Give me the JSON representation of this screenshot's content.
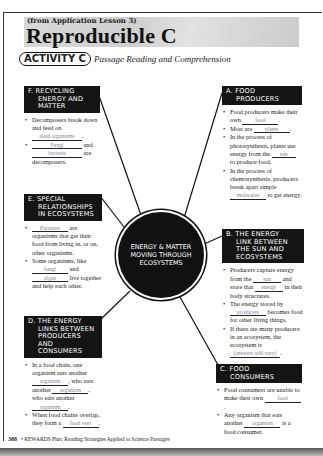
{
  "header": {
    "lesson_ref": "(from Application Lesson 3)",
    "title": "Reproducible C",
    "activity_badge": "ACTIVITY C",
    "activity_subtitle": "Passage Reading and Comprehension"
  },
  "center": {
    "line1": "ENERGY & MATTER",
    "line2": "MOVING THROUGH",
    "line3": "ECOSYSTEMS"
  },
  "panels": {
    "a": {
      "h1": "A.  FOOD",
      "h2": "PRODUCERS",
      "b1_pre": "Food producers make their own",
      "b1_ans": "food",
      "b1_post": ".",
      "b2_pre": "Most are",
      "b2_ans": "plants",
      "b2_post": ".",
      "b3_pre": "In the process of photosynthesis, plants use energy from the",
      "b3_ans": "sun",
      "b3_post": "to produce food.",
      "b4_pre": "In the process of chemosynthesis, producers break apart simple",
      "b4_ans": "molecules",
      "b4_post": "to get energy."
    },
    "b": {
      "h1": "B.  THE ENERGY",
      "h2": "LINK BETWEEN",
      "h3": "THE SUN AND",
      "h4": "ECOSYSTEMS",
      "b1_pre": "Producers capture energy from the",
      "b1_ans": "sun",
      "b1_mid": "and store that",
      "b1_ans2": "energy",
      "b1_post": "in their body structures.",
      "b2_pre": "The energy stored by",
      "b2_ans": "producers",
      "b2_post": "becomes food for other living things.",
      "b3_pre": "If there are many producers in an ecosystem, the ecosystem is",
      "b3_ans": "(answers will vary)",
      "b3_post": "."
    },
    "c": {
      "h1": "C.  FOOD",
      "h2": "CONSUMERS",
      "b1_pre": "Food consumers are unable to make their own",
      "b1_ans": "food",
      "b1_post": ".",
      "b2_pre": "Any organism that eats another",
      "b2_ans": "organism",
      "b2_post": "is a food consumer."
    },
    "d": {
      "h1": "D.  THE ENERGY",
      "h2": "LINKS BETWEEN",
      "h3": "PRODUCERS",
      "h4": "AND CONSUMERS",
      "b1_pre": "In a food chain, one organism eats another",
      "b1_ans": "organism",
      "b1_mid": ", who eats another",
      "b1_ans2": "organism",
      "b1_mid2": ", who eats another",
      "b1_ans3": "organism",
      "b1_post": ".",
      "b2_pre": "When food chains overlap, they form a",
      "b2_ans": "food web",
      "b2_post": "."
    },
    "e": {
      "h1": "E.  SPECIAL",
      "h2": "RELATIONSHIPS",
      "h3": "IN ECOSYSTEMS",
      "b1_ans": "Parasites",
      "b1_post": "are organisms that get their food from living in, or on, other organisms.",
      "b2_pre": "Some organisms, like",
      "b2_ans": "fungi",
      "b2_mid": "and",
      "b2_ans2": "algae",
      "b2_post": "live together and help each other."
    },
    "f": {
      "h1": "F.  RECYCLING",
      "h2": "ENERGY AND",
      "h3": "MATTER",
      "b1_pre": "Decomposers break down and feed on",
      "b1_ans": "dead organisms",
      "b1_post": ".",
      "b2_ans": "Fungi",
      "b2_mid": "and",
      "b2_ans2": "bacteria",
      "b2_post": "are decomposers."
    }
  },
  "footer": {
    "page_number": "388",
    "text": "REWARDS Plus: Reading Strategies Applied to Science Passages"
  },
  "colors": {
    "header_box": "#141414",
    "answer_ink": "#8c7a9a"
  }
}
